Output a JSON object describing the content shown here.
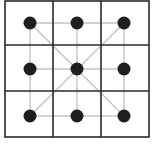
{
  "diagram": {
    "type": "3x3 grid board",
    "grid": {
      "rows": 3,
      "cols": 3
    },
    "colors": {
      "border": "#2a2a2a",
      "connector": "#c4c4c4",
      "dot": "#1e1e1e",
      "background": "#ffffff"
    },
    "dots": [
      {
        "row": 0,
        "col": 0
      },
      {
        "row": 0,
        "col": 1
      },
      {
        "row": 0,
        "col": 2
      },
      {
        "row": 1,
        "col": 0
      },
      {
        "row": 1,
        "col": 1
      },
      {
        "row": 1,
        "col": 2
      },
      {
        "row": 2,
        "col": 0
      },
      {
        "row": 2,
        "col": 1
      },
      {
        "row": 2,
        "col": 2
      }
    ],
    "connections": [
      "top-row",
      "middle-row",
      "bottom-row",
      "left-column",
      "middle-column",
      "right-column",
      "diagonal-tl-br",
      "diagonal-tr-bl"
    ]
  }
}
